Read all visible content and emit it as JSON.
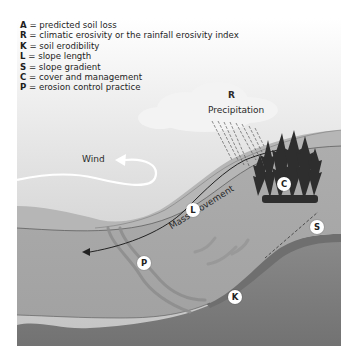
{
  "legend": [
    {
      "key": "A",
      "text": " = predicted soil loss"
    },
    {
      "key": "R",
      "text": " = climatic erosivity or the rainfall erosivity index"
    },
    {
      "key": "K",
      "text": " = soil erodibility"
    },
    {
      "key": "L",
      "text": " = slope length"
    },
    {
      "key": "S",
      "text": " = slope gradient"
    },
    {
      "key": "C",
      "text": " = cover and management"
    },
    {
      "key": "P",
      "text": " = erosion control practice"
    }
  ],
  "labels": {
    "r_label": "R",
    "precipitation": "Precipitation",
    "wind": "Wind",
    "mass_movement": "Mass movement"
  },
  "badges": {
    "c": "C",
    "l": "L",
    "s": "S",
    "p": "P",
    "k": "K"
  },
  "colors": {
    "sky_top": "#ffffff",
    "sky_bottom": "#c4c4c4",
    "upper_slope": "#b8b8b8",
    "soil_layer": "#a6a6a6",
    "bedrock": "#7e7e7e",
    "bedrock_dark": "#707070",
    "trees": "#2f2f2f"
  }
}
